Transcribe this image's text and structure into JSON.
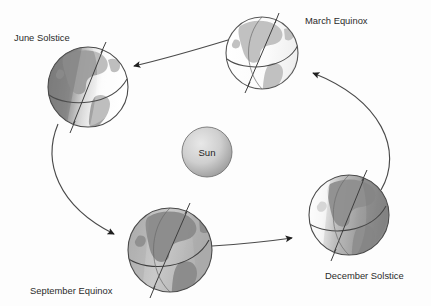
{
  "diagram": {
    "background_color": "#fdfdfd",
    "center_body": {
      "name": "sun",
      "label": "Sun",
      "cx": 207,
      "cy": 152,
      "r": 25,
      "color_light": "#e2e2e2",
      "color_dark": "#9a9a9a",
      "outline": "#6f6f6f"
    },
    "orbit": {
      "type": "ellipse-path",
      "direction": "counterclockwise",
      "stroke": "#4a4a4a",
      "arrow_color": "#262626"
    },
    "positions": [
      {
        "id": "june-solstice",
        "label": "June Solstice",
        "label_x": 14,
        "label_y": 41,
        "cx": 88,
        "cy": 87,
        "r": 40,
        "axis_tilt_deg": -23.5,
        "lit_side": "right",
        "ocean_color": "#cfcfcf",
        "land_color": "#a5a5a5",
        "shadow_color": "#8d8d8d",
        "highlight_color": "#fafafa",
        "outline": "#4a4a4a"
      },
      {
        "id": "march-equinox",
        "label": "March Equinox",
        "label_x": 305,
        "label_y": 24,
        "cx": 262,
        "cy": 53,
        "r": 36,
        "axis_tilt_deg": -23.5,
        "lit_side": "full",
        "ocean_color": "#f4f4f4",
        "land_color": "#c2c2c2",
        "shadow_color": "#bdbdbd",
        "highlight_color": "#ffffff",
        "outline": "#585858"
      },
      {
        "id": "december-solstice",
        "label": "December Solstice",
        "label_x": 325,
        "label_y": 279,
        "cx": 349,
        "cy": 215,
        "r": 40,
        "axis_tilt_deg": -23.5,
        "lit_side": "left",
        "ocean_color": "#c6c6c6",
        "land_color": "#9a9a9a",
        "shadow_color": "#8a8a8a",
        "highlight_color": "#f2f2f2",
        "outline": "#4a4a4a"
      },
      {
        "id": "september-equinox",
        "label": "September Equinox",
        "label_x": 30,
        "label_y": 294,
        "cx": 170,
        "cy": 250,
        "r": 42,
        "axis_tilt_deg": -23.5,
        "lit_side": "full",
        "ocean_color": "#c4c4c4",
        "land_color": "#8e8e8e",
        "shadow_color": "#8a8a8a",
        "highlight_color": "#dedede",
        "outline": "#4a4a4a"
      }
    ],
    "arrows": [
      {
        "id": "arrow-march-to-june",
        "from": "march-equinox",
        "to": "june-solstice",
        "tip_x": 131,
        "tip_y": 67
      },
      {
        "id": "arrow-june-to-september",
        "from": "june-solstice",
        "to": "september-equinox",
        "tip_x": 118,
        "tip_y": 236
      },
      {
        "id": "arrow-september-to-december",
        "from": "september-equinox",
        "to": "december-solstice",
        "tip_x": 296,
        "tip_y": 238
      },
      {
        "id": "arrow-december-to-march",
        "from": "december-solstice",
        "to": "march-equinox",
        "tip_x": 310,
        "tip_y": 72
      }
    ]
  }
}
